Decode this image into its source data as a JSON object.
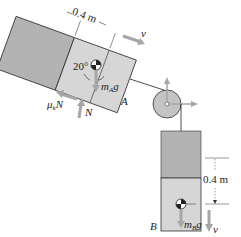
{
  "diagram": {
    "type": "free-body / kinematics diagram",
    "block_A": {
      "label": "A",
      "width_label": "0.4 m",
      "angle_label": "20°",
      "weight_label_main": "m",
      "weight_label_sub": "A",
      "weight_label_suffix": "g",
      "velocity_label": "v",
      "normal_label": "N",
      "friction_label_main": "μ",
      "friction_label_sub": "k",
      "friction_label_suffix": "N"
    },
    "block_B": {
      "label": "B",
      "displacement_label": "0.4 m",
      "weight_label_main": "m",
      "weight_label_sub": "B",
      "weight_label_suffix": "g",
      "velocity_label": "v"
    },
    "colors": {
      "block_fill": "#d6d6d6",
      "block_prev_fill": "#b3b3b3",
      "pulley_fill": "#c4c4c4",
      "arrow_gray": "#a6a6a6",
      "line": "#222222"
    }
  }
}
